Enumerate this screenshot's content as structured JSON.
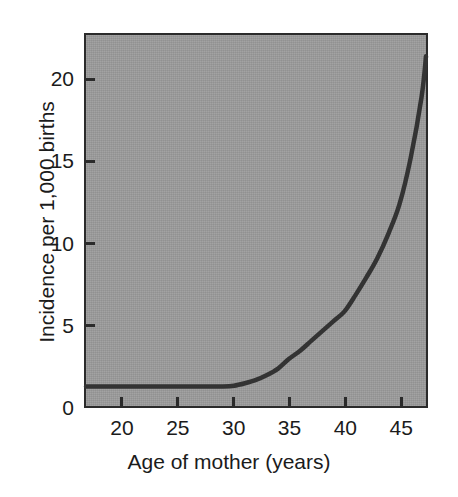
{
  "chart_data": {
    "type": "line",
    "title": "",
    "xlabel": "Age of mother (years)",
    "ylabel": "Incidence per 1,000 births",
    "xlim": [
      16.6,
      47.4
    ],
    "ylim": [
      0,
      22.8
    ],
    "grid": false,
    "legend": "none",
    "xticks": [
      20,
      25,
      30,
      35,
      40,
      45
    ],
    "xtick_labels": [
      "20",
      "25",
      "30",
      "35",
      "40",
      "45"
    ],
    "yticks": [
      0,
      5,
      10,
      15,
      20
    ],
    "ytick_labels": [
      "0",
      "5",
      "10",
      "15",
      "20"
    ],
    "series": [
      {
        "name": "Incidence",
        "x": [
          16.6,
          18,
          20,
          22,
          24,
          26,
          28,
          29,
          30,
          31,
          32,
          33,
          34,
          35,
          36,
          37,
          38,
          39,
          40,
          41,
          42,
          43,
          44,
          45,
          46,
          47,
          47.4
        ],
        "y": [
          1.2,
          1.2,
          1.2,
          1.2,
          1.2,
          1.2,
          1.2,
          1.2,
          1.25,
          1.4,
          1.6,
          1.9,
          2.3,
          2.9,
          3.4,
          4.0,
          4.6,
          5.2,
          5.8,
          6.8,
          7.9,
          9.1,
          10.6,
          12.4,
          15.2,
          19.0,
          21.5
        ]
      }
    ],
    "colors": {
      "plot_background": "#9b9b9b",
      "axis": "#2b2b2b",
      "curve": "#333333",
      "page_background": "#ffffff",
      "text": "#1b1b1b"
    },
    "annotations": []
  },
  "figure": {
    "x_axis_title": "Age of mother (years)",
    "y_axis_title": "Incidence per 1,000 births"
  }
}
